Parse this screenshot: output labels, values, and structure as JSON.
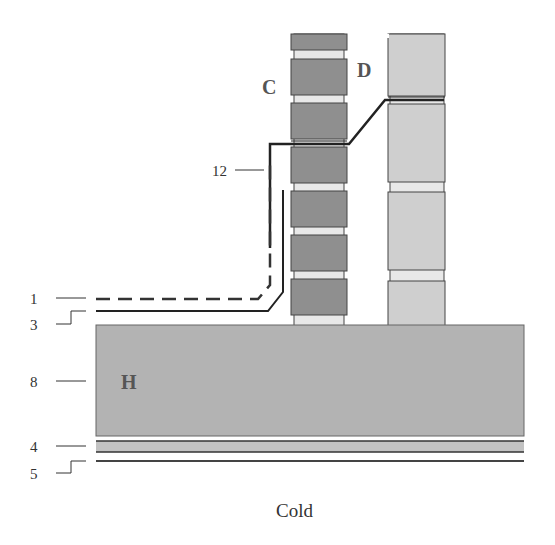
{
  "diagram": {
    "callouts": [
      {
        "id": "1",
        "label": "1",
        "target": "dashed-line"
      },
      {
        "id": "3",
        "label": "3",
        "target": "solid-line"
      },
      {
        "id": "8",
        "label": "8",
        "target": "slab-H"
      },
      {
        "id": "4",
        "label": "4",
        "target": "layer-4"
      },
      {
        "id": "5",
        "label": "5",
        "target": "layer-5"
      },
      {
        "id": "12",
        "label": "12",
        "target": "stepped-line"
      }
    ],
    "regions": {
      "C": "C",
      "D": "D",
      "H": "H"
    },
    "caption": "Cold",
    "colors": {
      "column_c_block": "#8f8f8f",
      "column_c_gap": "#e8e8e8",
      "column_d_block": "#cfcfcf",
      "slab": "#b3b3b3",
      "line": "#222222"
    }
  }
}
